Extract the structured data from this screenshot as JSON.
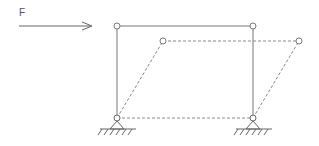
{
  "diagram": {
    "force_label": "F",
    "colors": {
      "stroke": "#777777",
      "dashed": "#888888",
      "hinge_fill": "#ffffff"
    }
  }
}
